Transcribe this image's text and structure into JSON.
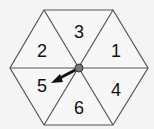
{
  "spinner": {
    "shape": "hexagon",
    "sections": [
      {
        "label": "1",
        "x": 116,
        "y": 57
      },
      {
        "label": "2",
        "x": 42,
        "y": 57
      },
      {
        "label": "3",
        "x": 79,
        "y": 38
      },
      {
        "label": "4",
        "x": 116,
        "y": 96
      },
      {
        "label": "5",
        "x": 42,
        "y": 92
      },
      {
        "label": "6",
        "x": 79,
        "y": 114
      }
    ],
    "arrow_points_to": "5",
    "colors": {
      "fill": "#f7f7f7",
      "stroke": "#555555",
      "arrow": "#111111",
      "pivot": "#777777"
    }
  }
}
